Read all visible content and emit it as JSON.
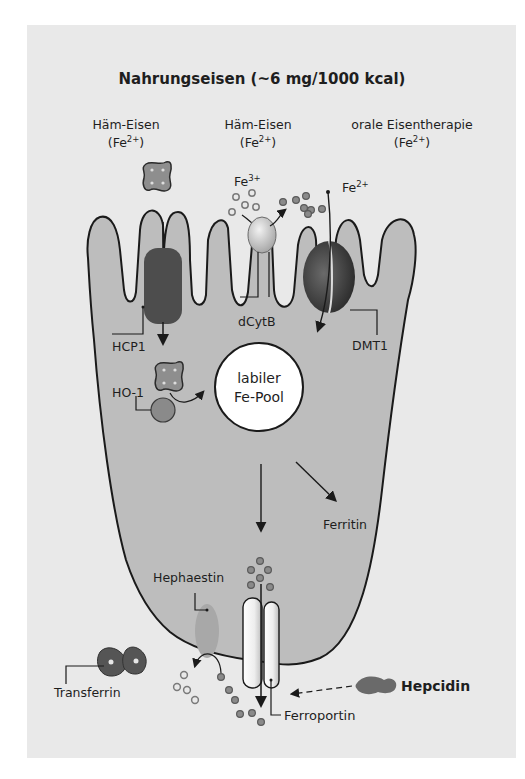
{
  "figure": {
    "title": "Nahrungseisen (~6 mg/1000 kcal)",
    "sources": [
      {
        "name": "Häm-Eisen",
        "ion": "(Fe",
        "sup": "2+",
        "close": ")"
      },
      {
        "name": "Häm-Eisen",
        "ion": "(Fe",
        "sup": "2+",
        "close": ")"
      },
      {
        "name": "orale Eisentherapie",
        "ion": "(Fe",
        "sup": "2+",
        "close": ")"
      }
    ],
    "ions": {
      "fe3": {
        "base": "Fe",
        "sup": "3+"
      },
      "fe2": {
        "base": "Fe",
        "sup": "2+"
      }
    },
    "labels": {
      "hcp1": "HCP1",
      "dcytb": "dCytB",
      "dmt1": "DMT1",
      "ho1": "HO-1",
      "pool_line1": "labiler",
      "pool_line2": "Fe-Pool",
      "ferritin": "Ferritin",
      "hephaestin": "Hephaestin",
      "transferrin": "Transferrin",
      "hepcidin": "Hepcidin",
      "ferroportin": "Ferroportin"
    },
    "colors": {
      "background": "#e9e9e9",
      "cell_fill": "#bdbdbd",
      "outline": "#1a1a1a",
      "transporter_dark": "#4a4a4a",
      "pool_fill": "#ffffff",
      "ion_fill": "#7a7a7a"
    }
  }
}
